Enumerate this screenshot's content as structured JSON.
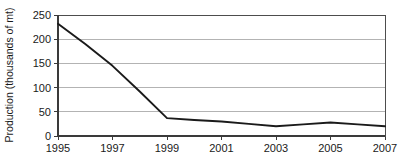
{
  "chart_data": {
    "type": "line",
    "title": "",
    "xlabel": "",
    "ylabel": "Production (thousands of mt)",
    "xlim": [
      1995,
      2007
    ],
    "ylim": [
      0,
      250
    ],
    "grid": true,
    "legend": "none",
    "y_ticks": [
      0,
      50,
      100,
      150,
      200,
      250
    ],
    "y_tick_labels": [
      "0",
      "50",
      "100",
      "150",
      "200",
      "250"
    ],
    "x_ticks": [
      1995,
      1997,
      1999,
      2001,
      2003,
      2005,
      2007
    ],
    "x_tick_labels": [
      "1995",
      "1997",
      "1999",
      "2001",
      "2003",
      "2005",
      "2007"
    ],
    "line_color": "#1a1a1a",
    "grid_color": "#b3b3b3",
    "background_color": "#ffffff",
    "x": [
      1995,
      1996,
      1997,
      1998,
      1999,
      2000,
      2001,
      2002,
      2003,
      2004,
      2005,
      2006,
      2007
    ],
    "values": [
      232,
      190,
      145,
      92,
      37,
      33,
      30,
      25,
      20,
      24,
      28,
      24,
      20
    ],
    "series": [
      {
        "name": "Production",
        "x": [
          1995,
          1996,
          1997,
          1998,
          1999,
          2000,
          2001,
          2002,
          2003,
          2004,
          2005,
          2006,
          2007
        ],
        "values": [
          232,
          190,
          145,
          92,
          37,
          33,
          30,
          25,
          20,
          24,
          28,
          24,
          20
        ]
      }
    ]
  },
  "axes": {
    "y_title": "Production (thousands of mt)"
  }
}
